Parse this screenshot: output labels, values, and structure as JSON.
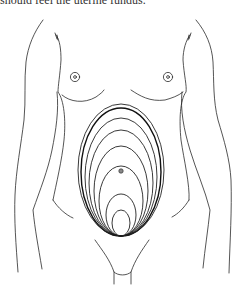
{
  "caption": {
    "text": "should feel the uterine fundus."
  },
  "figure": {
    "umbilicus": {
      "x": 121,
      "y": 171
    },
    "fundal_ellipses": [
      {
        "cx": 121,
        "cy": 222,
        "rx": 9,
        "ry": 13
      },
      {
        "cx": 121,
        "cy": 214,
        "rx": 14,
        "ry": 22
      },
      {
        "cx": 121,
        "cy": 200,
        "rx": 21,
        "ry": 36
      },
      {
        "cx": 121,
        "cy": 190,
        "rx": 27,
        "ry": 46
      },
      {
        "cx": 121,
        "cy": 182,
        "rx": 32,
        "ry": 54
      },
      {
        "cx": 121,
        "cy": 176,
        "rx": 36,
        "ry": 60
      },
      {
        "cx": 121,
        "cy": 170,
        "rx": 40,
        "ry": 66,
        "bold": true
      },
      {
        "cx": 121,
        "cy": 168,
        "rx": 43,
        "ry": 68
      }
    ],
    "colors": {
      "line": "#2a2a2a",
      "background": "#ffffff"
    }
  }
}
